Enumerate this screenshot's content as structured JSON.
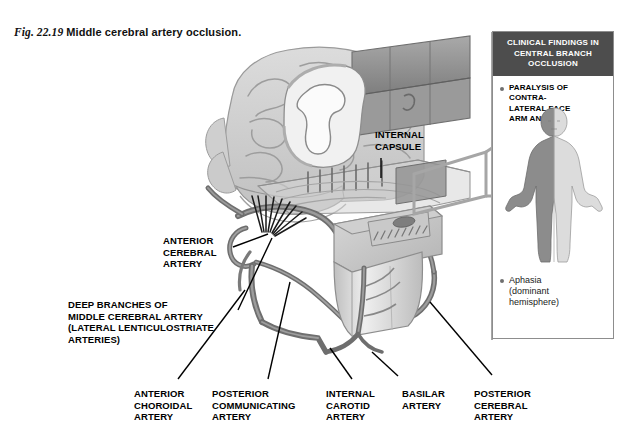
{
  "figure": {
    "number": "Fig. 22.19",
    "caption": "Middle cerebral artery occlusion."
  },
  "clinical_box": {
    "header": "CLINICAL FINDINGS IN\nCENTRAL BRANCH\nOCCLUSION",
    "findings": [
      {
        "text": "PARALYSIS OF\n   CONTRA-\n   LATERAL FACE\n   ARM AND LEG",
        "style": "caps"
      },
      {
        "text": "Aphasia\n(dominant\nhemisphere)",
        "style": "mixed"
      }
    ],
    "figure_alt": "body-hemiparesis-figure"
  },
  "labels": {
    "internal_capsule": "INTERNAL\nCAPSULE",
    "anterior_cerebral_artery": "ANTERIOR\nCEREBRAL\nARTERY",
    "deep_branches": "DEEP BRANCHES OF\nMIDDLE CEREBRAL ARTERY\n(LATERAL LENTICULOSTRIATE\nARTERIES)",
    "anterior_choroidal_artery": "ANTERIOR\nCHOROIDAL\nARTERY",
    "posterior_communicating_artery": "POSTERIOR\nCOMMUNICATING\nARTERY",
    "internal_carotid_artery": "INTERNAL\nCAROTID\nARTERY",
    "basilar_artery": "BASILAR\nARTERY",
    "posterior_cerebral_artery": "POSTERIOR\nCEREBRAL\nARTERY"
  },
  "colors": {
    "header_bar": "#4d4d4d",
    "box_border": "#8d8d8d",
    "brain_light": "#d2d2d2",
    "brain_mid": "#bdbdbd",
    "brain_dark": "#8f8f8f",
    "artery_dark": "#6e6e6e",
    "leader_line": "#000000",
    "background": "#ffffff",
    "body_affected": "#8c8c8c",
    "body_normal": "#dcdcdc"
  }
}
